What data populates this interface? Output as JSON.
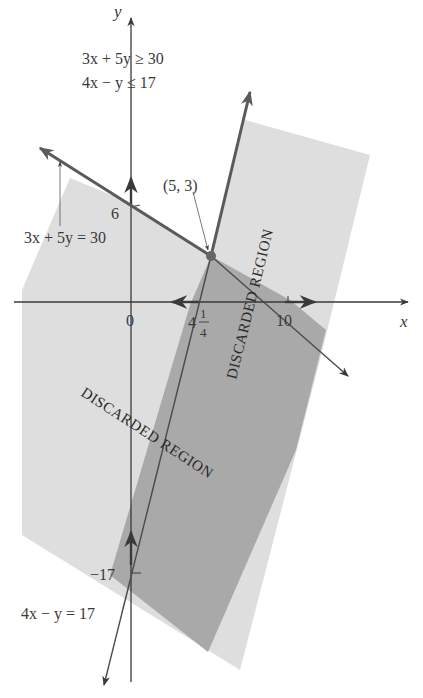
{
  "figure": {
    "axes": {
      "x_label": "x",
      "y_label": "y"
    },
    "system": {
      "line1": "3x + 5y ≥ 30",
      "line2": "4x − y ≤ 17"
    },
    "lines": [
      {
        "name": "3x + 5y = 30",
        "label": "3x + 5y = 30"
      },
      {
        "name": "4x − y = 17",
        "label": "4x − y = 17"
      }
    ],
    "point": {
      "label": "(5, 3)"
    },
    "ticks": {
      "y6": "6",
      "origin": "0",
      "x_int_a_whole": "4",
      "x_int_a_num": "1",
      "x_int_a_den": "4",
      "x10": "10",
      "y_neg17": "−17"
    },
    "regions": {
      "r1": "DISCARDED REGION",
      "r2": "DISCARDED REGION"
    },
    "colors": {
      "light_region": "#dedede",
      "dark_region": "#a9a9a9",
      "line": "#5a5a5a",
      "axis": "#3a3a3a",
      "text": "#3a3a3a"
    }
  }
}
